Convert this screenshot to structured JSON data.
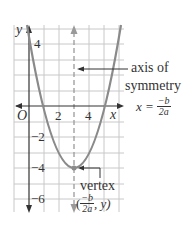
{
  "figure": {
    "type": "parabola-graph",
    "colors": {
      "grid": "#c8c8c8",
      "axis": "#333333",
      "curve": "#8a8a8a",
      "symmetry_axis": "#9a9a9a",
      "text": "#333333"
    },
    "axes": {
      "x_label": "x",
      "y_label": "y",
      "origin_label": "O",
      "x_ticks": [
        "2",
        "4"
      ],
      "y_ticks": [
        "4",
        "−2",
        "−4",
        "−6"
      ]
    },
    "annotations": {
      "axis_of_symmetry": {
        "line1": "axis of",
        "line2": "symmetry",
        "formula_lhs": "x =",
        "formula_num": "−b",
        "formula_den": "2a"
      },
      "vertex": {
        "label": "vertex",
        "coord_open": "(",
        "coord_num": "−b",
        "coord_den": "2a",
        "coord_rest": ", y)"
      }
    },
    "curve": {
      "vertex": [
        3,
        -4
      ],
      "equation_shape": "upward parabola"
    }
  }
}
